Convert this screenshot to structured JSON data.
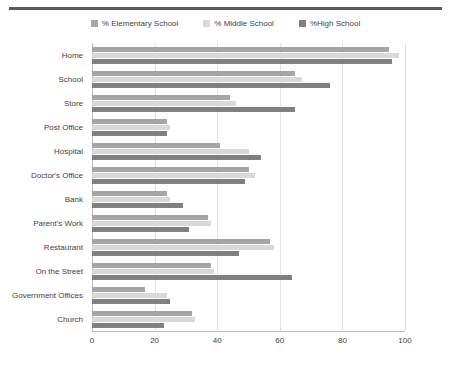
{
  "chart_data": {
    "type": "bar",
    "orientation": "horizontal",
    "title": "",
    "subtitle": "",
    "xlabel": "",
    "ylabel": "",
    "xlim": [
      0,
      100
    ],
    "xticks": [
      0,
      20,
      40,
      60,
      80,
      100
    ],
    "grid": "vertical",
    "legend_position": "top-center",
    "categories": [
      "Home",
      "School",
      "Store",
      "Post Office",
      "Hospital",
      "Doctor's Office",
      "Bank",
      "Parent's Work",
      "Restaurant",
      "On the Street",
      "Government Offices",
      "Church"
    ],
    "series": [
      {
        "name": "% Elementary School",
        "color": "#a6a6a6",
        "values": [
          95,
          65,
          44,
          24,
          41,
          50,
          24,
          37,
          57,
          38,
          17,
          32
        ]
      },
      {
        "name": "% Middle School",
        "color": "#d9d9d9",
        "values": [
          98,
          67,
          46,
          25,
          50,
          52,
          25,
          38,
          58,
          39,
          24,
          33
        ]
      },
      {
        "name": "%High School",
        "color": "#808080",
        "values": [
          96,
          76,
          65,
          24,
          54,
          49,
          29,
          31,
          47,
          64,
          25,
          23
        ]
      }
    ]
  }
}
